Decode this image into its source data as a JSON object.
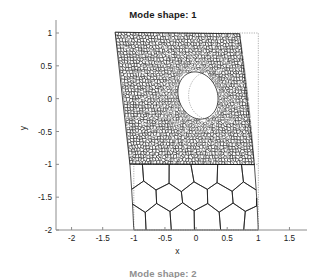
{
  "figure": {
    "title": "Mode shape: 1",
    "next_subplot_title": "Mode shape: 2",
    "width": 326,
    "height": 278,
    "background": "#ffffff"
  },
  "axes": {
    "xlabel": "x",
    "ylabel": "y",
    "xlim": [
      -2.25,
      1.75
    ],
    "ylim": [
      -2.1,
      1.22
    ],
    "xticks": [
      -2,
      -1.5,
      -1,
      -0.5,
      0,
      0.5,
      1,
      1.5
    ],
    "xtick_labels": [
      "-2",
      "-1.5",
      "-1",
      "-0.5",
      "0",
      "0.5",
      "1",
      "1.5"
    ],
    "yticks": [
      1,
      0.5,
      0,
      -0.5,
      -1,
      -1.5,
      -2
    ],
    "ytick_labels": [
      "1",
      "0.5",
      "0",
      "-0.5",
      "-1",
      "-1.5",
      "-2"
    ],
    "grid": false,
    "box": "left-bottom",
    "axis_color": "#8c8c8c",
    "tick_color": "#8c8c8c",
    "plot_left_px": 56,
    "plot_right_px": 305,
    "plot_top_px": 33,
    "plot_bottom_px": 230
  },
  "chart_data": {
    "type": "mesh-deformation",
    "title": "Mode shape: 1",
    "xlabel": "x",
    "ylabel": "y",
    "xlim": [
      -2.25,
      1.75
    ],
    "ylim": [
      -2.1,
      1.22
    ],
    "grid": false,
    "legend": null,
    "regions": [
      {
        "name": "perforated-plate",
        "mesh": "fine-voronoi",
        "undeformed_bounds": {
          "x": [
            -1,
            1
          ],
          "y": [
            -1,
            1
          ]
        },
        "hole": {
          "shape": "ellipse",
          "center": [
            0.2,
            0.05
          ],
          "rx": 0.32,
          "ry": 0.36
        },
        "cell_count_approx": 1400,
        "line_color": "#1a1a1a"
      },
      {
        "name": "honeycomb-foam",
        "mesh": "coarse-hexagonal",
        "undeformed_bounds": {
          "x": [
            -1,
            1
          ],
          "y": [
            -2,
            -1
          ]
        },
        "cell_count_approx": 22,
        "line_color": "#1a1a1a"
      }
    ],
    "deformation": {
      "mode_number": 1,
      "type": "lateral-shear-sway",
      "top_edge_shift_x": -0.3,
      "bottom_edge_shift_x": 0.0,
      "interface_shift_x": -0.04,
      "description": "Top edge of the plate sways toward negative x while the base at y=-2 is fixed, producing a shear/tilt mode."
    },
    "reference_outline": {
      "style": "dotted",
      "color": "#8c8c8c",
      "x": [
        -1,
        1
      ],
      "y": [
        -2,
        1
      ]
    }
  }
}
